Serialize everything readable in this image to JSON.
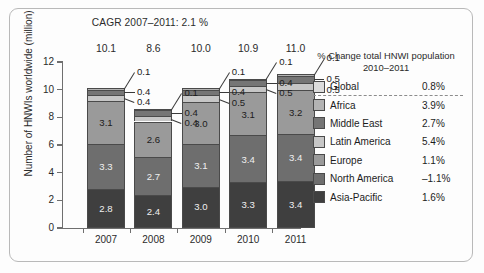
{
  "chart_data": {
    "type": "bar",
    "subtype": "stacked",
    "title": "CAGR 2007–2011: 2.1 %",
    "xlabel": "",
    "ylabel": "Number of HNWIs worldwide (million)",
    "ylim": [
      0,
      12
    ],
    "yticks": [
      0,
      2,
      4,
      6,
      8,
      10,
      12
    ],
    "ytick_labels": [
      "0",
      "2",
      "4",
      "6",
      "8",
      "10",
      "12"
    ],
    "grid": false,
    "legend_position": "right",
    "categories": [
      "2007",
      "2008",
      "2009",
      "2010",
      "2011"
    ],
    "totals": [
      "10.1",
      "8.6",
      "10.0",
      "10.9",
      "11.0"
    ],
    "series": [
      {
        "name": "Asia-Pacific",
        "color": "#3f3f3f",
        "values": [
          2.8,
          2.4,
          3.0,
          3.3,
          3.4
        ],
        "labels": [
          "2.8",
          "2.4",
          "3.0",
          "3.3",
          "3.4"
        ]
      },
      {
        "name": "North America",
        "color": "#6e6e6e",
        "values": [
          3.3,
          2.7,
          3.1,
          3.4,
          3.4
        ],
        "labels": [
          "3.3",
          "2.7",
          "3.1",
          "3.4",
          "3.4"
        ]
      },
      {
        "name": "Europe",
        "color": "#9a9a9a",
        "values": [
          3.1,
          2.6,
          3.0,
          3.1,
          3.2
        ],
        "labels": [
          "3.1",
          "2.6",
          "3.0",
          "3.1",
          "3.2"
        ]
      },
      {
        "name": "Latin America",
        "color": "#c6c6c6",
        "values": [
          0.4,
          0.4,
          0.5,
          0.5,
          0.5
        ],
        "labels": [
          "0.4",
          "0.4",
          "0.5",
          "0.5",
          "0.5"
        ]
      },
      {
        "name": "Middle East",
        "color": "#757575",
        "values": [
          0.4,
          0.4,
          0.4,
          0.4,
          0.5
        ],
        "labels": [
          "0.4",
          "0.4",
          "0.4",
          "0.4",
          "0.5"
        ]
      },
      {
        "name": "Africa",
        "color": "#b3b3b3",
        "values": [
          0.1,
          0.1,
          0.1,
          0.1,
          0.1
        ],
        "labels": [
          "0.1",
          "0.1",
          "0.1",
          "0.1",
          "0.1"
        ]
      }
    ]
  },
  "legend": {
    "header_line1": "% Change total HNWI population",
    "header_line2": "2010–2011",
    "items": [
      {
        "label": "Global",
        "value": "0.8%",
        "color": "#dcdcdc"
      },
      {
        "label": "Africa",
        "value": "3.9%",
        "color": "#b3b3b3"
      },
      {
        "label": "Middle East",
        "value": "2.7%",
        "color": "#757575"
      },
      {
        "label": "Latin America",
        "value": "5.4%",
        "color": "#c6c6c6"
      },
      {
        "label": "Europe",
        "value": "1.1%",
        "color": "#9a9a9a"
      },
      {
        "label": "North America",
        "value": "–1.1%",
        "color": "#6e6e6e"
      },
      {
        "label": "Asia-Pacific",
        "value": "1.6%",
        "color": "#3f3f3f"
      }
    ]
  },
  "callouts": {
    "2007": [
      "0.1",
      "0.4",
      "0.4"
    ],
    "2008": [
      "0.1",
      "0.4",
      "0.4"
    ],
    "2009": [
      "0.1",
      "0.4",
      "0.5"
    ],
    "2010": [
      "0.1",
      "0.4",
      "0.5"
    ],
    "2011": [
      "0.1",
      "0.5",
      "0.5"
    ]
  }
}
